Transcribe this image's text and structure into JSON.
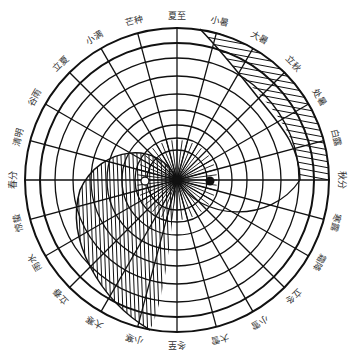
{
  "diagram": {
    "center": [
      177,
      180
    ],
    "outer_radius": 152,
    "ring_radii": [
      152,
      137,
      122,
      104,
      86,
      70,
      55,
      42,
      30
    ],
    "colors": {
      "ink": "#111111",
      "label": "#333333",
      "background": "#ffffff"
    },
    "solar_terms": [
      {
        "name": "夏至",
        "angle": 0
      },
      {
        "name": "小暑",
        "angle": 15
      },
      {
        "name": "大暑",
        "angle": 30
      },
      {
        "name": "立秋",
        "angle": 45
      },
      {
        "name": "处暑",
        "angle": 60
      },
      {
        "name": "白露",
        "angle": 75
      },
      {
        "name": "秋分",
        "angle": 90
      },
      {
        "name": "寒露",
        "angle": 105
      },
      {
        "name": "霜降",
        "angle": 120
      },
      {
        "name": "立冬",
        "angle": 135
      },
      {
        "name": "小雪",
        "angle": 150
      },
      {
        "name": "大雪",
        "angle": 165
      },
      {
        "name": "冬至",
        "angle": 180
      },
      {
        "name": "小寒",
        "angle": 195
      },
      {
        "name": "大寒",
        "angle": 210
      },
      {
        "name": "立春",
        "angle": 225
      },
      {
        "name": "雨水",
        "angle": 240
      },
      {
        "name": "惊蛰",
        "angle": 255
      },
      {
        "name": "春分",
        "angle": 270
      },
      {
        "name": "清明",
        "angle": 285
      },
      {
        "name": "谷雨",
        "angle": 300
      },
      {
        "name": "立夏",
        "angle": 315
      },
      {
        "name": "小满",
        "angle": 330
      },
      {
        "name": "芒种",
        "angle": 345
      }
    ],
    "markers": {
      "yang_eye": {
        "type": "hollow-dot",
        "x": 145,
        "y": 181
      },
      "yin_eye": {
        "type": "solid-dot",
        "x": 210,
        "y": 181
      }
    },
    "regions": {
      "yin_hatched_left": "阴影 (hatched shadow region, left lower)",
      "yang_hatched_right": "阳影 (hatched shadow band, right upper)"
    }
  }
}
